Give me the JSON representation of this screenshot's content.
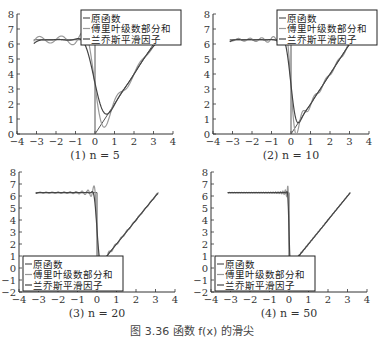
{
  "figure_caption": "图 3.36  函数 f(x) 的滑尖",
  "legend_labels": [
    "原函数",
    "傅里叶级数部分和",
    "兰乔斯平滑因子"
  ],
  "colors": {
    "original": "#555555",
    "fourier": "#999999",
    "lanczos": "#444444",
    "axis": "#333333"
  },
  "chart_data": [
    {
      "type": "line",
      "caption": "(1) n = 5",
      "n": 5,
      "xlim": [
        -4,
        4
      ],
      "ylim": [
        0,
        8
      ],
      "xticks": [
        -4,
        -3,
        -2,
        -1,
        0,
        1,
        2,
        3,
        4
      ],
      "yticks": [
        0,
        1,
        2,
        3,
        4,
        5,
        6,
        7,
        8
      ],
      "legend_position": "upper right",
      "series": [
        {
          "name": "原函数",
          "description": "f(x)=2π for x<0 (on [-π,0)), f(x)=2x for x≥0 up to π"
        },
        {
          "name": "傅里叶级数部分和",
          "description": "partial Fourier sum with Gibbs oscillation"
        },
        {
          "name": "兰乔斯平滑因子",
          "description": "Lanczos sigma-smoothed sum"
        }
      ],
      "frame": {
        "x": 17,
        "y": 14,
        "w": 156,
        "h": 120
      }
    },
    {
      "type": "line",
      "caption": "(2) n = 10",
      "n": 10,
      "xlim": [
        -4,
        4
      ],
      "ylim": [
        0,
        8
      ],
      "xticks": [
        -4,
        -3,
        -2,
        -1,
        0,
        1,
        2,
        3,
        4
      ],
      "yticks": [
        0,
        1,
        2,
        3,
        4,
        5,
        6,
        7,
        8
      ],
      "legend_position": "upper right",
      "series": [
        {
          "name": "原函数"
        },
        {
          "name": "傅里叶级数部分和"
        },
        {
          "name": "兰乔斯平滑因子"
        }
      ],
      "frame": {
        "x": 213,
        "y": 14,
        "w": 156,
        "h": 120
      }
    },
    {
      "type": "line",
      "caption": "(3) n = 20",
      "n": 20,
      "xlim": [
        -4,
        4
      ],
      "ylim": [
        -2,
        8
      ],
      "xticks": [
        -4,
        -3,
        -2,
        -1,
        0,
        1,
        2,
        3,
        4
      ],
      "yticks": [
        -2,
        -1,
        0,
        1,
        2,
        3,
        4,
        5,
        6,
        7,
        8
      ],
      "legend_position": "lower left",
      "series": [
        {
          "name": "原函数"
        },
        {
          "name": "傅里叶级数部分和"
        },
        {
          "name": "兰乔斯平滑因子"
        }
      ],
      "frame": {
        "x": 19,
        "y": 172,
        "w": 156,
        "h": 120
      }
    },
    {
      "type": "line",
      "caption": "(4) n = 50",
      "n": 50,
      "xlim": [
        -4,
        4
      ],
      "ylim": [
        -2,
        8
      ],
      "xticks": [
        -4,
        -3,
        -2,
        -1,
        0,
        1,
        2,
        3,
        4
      ],
      "yticks": [
        -2,
        -1,
        0,
        1,
        2,
        3,
        4,
        5,
        6,
        7,
        8
      ],
      "legend_position": "lower left",
      "series": [
        {
          "name": "原函数"
        },
        {
          "name": "傅里叶级数部分和"
        },
        {
          "name": "兰乔斯平滑因子"
        }
      ],
      "frame": {
        "x": 211,
        "y": 172,
        "w": 156,
        "h": 120
      }
    }
  ]
}
